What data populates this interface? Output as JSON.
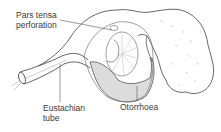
{
  "diagram": {
    "labels": {
      "pars_tensa_perforation": "Pars tensa\nperforation",
      "eustachian_tube": "Eustachian\ntube",
      "otorrhoea": "Otorrhoea"
    },
    "colors": {
      "line": "#555555",
      "fluid_fill": "#dcdcdc",
      "background": "#ffffff"
    }
  }
}
